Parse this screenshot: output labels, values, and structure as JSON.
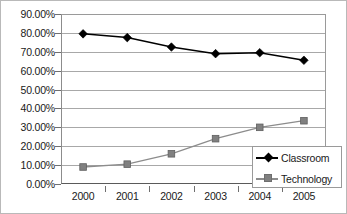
{
  "chart_data": {
    "type": "line",
    "title": "",
    "xlabel": "",
    "ylabel": "",
    "categories": [
      "2000",
      "2001",
      "2002",
      "2003",
      "2004",
      "2005"
    ],
    "ylim": [
      0,
      90
    ],
    "y_tick_labels": [
      "90.00%",
      "80.00%",
      "70.00%",
      "60.00%",
      "50.00%",
      "40.00%",
      "30.00%",
      "20.00%",
      "10.00%",
      "0.00%"
    ],
    "y_tick_values": [
      90,
      80,
      70,
      60,
      50,
      40,
      30,
      20,
      10,
      0
    ],
    "grid": true,
    "legend_position": "bottom-right",
    "series": [
      {
        "name": "Classroom",
        "marker": "diamond",
        "color": "#000000",
        "values": [
          79.5,
          77.5,
          72.5,
          69.0,
          69.5,
          65.5
        ]
      },
      {
        "name": "Technology",
        "marker": "square",
        "color": "#808080",
        "values": [
          9.0,
          10.5,
          16.0,
          24.0,
          30.0,
          33.5
        ]
      }
    ]
  },
  "legend": {
    "items": [
      {
        "label": "Classroom"
      },
      {
        "label": "Technology"
      }
    ]
  }
}
